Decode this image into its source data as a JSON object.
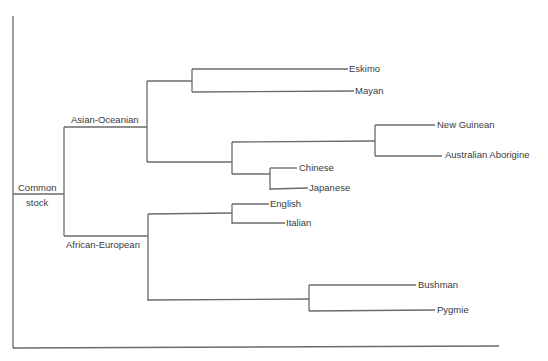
{
  "diagram": {
    "type": "tree",
    "root": {
      "label_line1": "Common",
      "label_line2": "stock"
    },
    "groups": [
      {
        "label": "Asian-Oceanian"
      },
      {
        "label": "African-European"
      }
    ],
    "leaves": [
      {
        "label": "Eskimo"
      },
      {
        "label": "Mayan"
      },
      {
        "label": "New Guinean"
      },
      {
        "label": "Australian Aborigine"
      },
      {
        "label": "Chinese"
      },
      {
        "label": "Japanese"
      },
      {
        "label": "English"
      },
      {
        "label": "Italian"
      },
      {
        "label": "Bushman"
      },
      {
        "label": "Pygmie"
      }
    ],
    "structure": {
      "Common stock": {
        "Asian-Oceanian": {
          "A": [
            "Eskimo",
            "Mayan"
          ],
          "B": {
            "B1": [
              "New Guinean",
              "Australian Aborigine"
            ],
            "B2": [
              "Chinese",
              "Japanese"
            ]
          }
        },
        "African-European": {
          "C": [
            "English",
            "Italian"
          ],
          "D": [
            "Bushman",
            "Pygmie"
          ]
        }
      }
    },
    "line_color": "#6a6a6a",
    "text_color": "#3a3a3a"
  }
}
